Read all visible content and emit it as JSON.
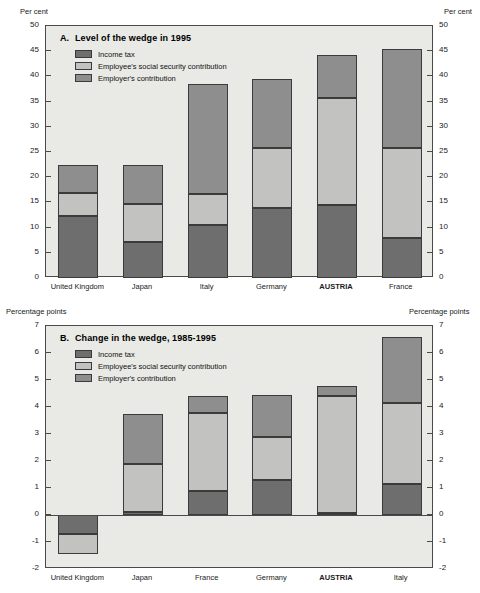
{
  "chart_data": [
    {
      "type": "bar",
      "panel": "A",
      "panel_letter": "A.",
      "title": "Level of the wedge in 1995",
      "xlabel": "",
      "ylabel": "Per cent",
      "ylabel_left": "Per cent",
      "ylabel_right": "Per cent",
      "ylim": [
        0,
        50
      ],
      "yticks": [
        0,
        5,
        10,
        15,
        20,
        25,
        30,
        35,
        40,
        45,
        50
      ],
      "grid": false,
      "stacked": true,
      "legend_position": "inside-top-left",
      "categories": [
        "United Kingdom",
        "Japan",
        "Italy",
        "Germany",
        "AUSTRIA",
        "France"
      ],
      "highlight_category": "AUSTRIA",
      "series": [
        {
          "name": "Income tax",
          "color": "#6e6e6e",
          "values": [
            12.3,
            7.2,
            10.6,
            13.8,
            14.5,
            7.9
          ]
        },
        {
          "name": "Employee's social security contribution",
          "color": "#c2c2c0",
          "values": [
            4.5,
            7.5,
            6.0,
            11.9,
            21.3,
            17.8
          ]
        },
        {
          "name": "Employer's contribution",
          "color": "#8e8e8e",
          "values": [
            5.6,
            7.7,
            21.9,
            13.8,
            8.4,
            19.8
          ]
        }
      ],
      "totals": [
        22.4,
        22.4,
        38.5,
        39.5,
        44.2,
        45.5
      ]
    },
    {
      "type": "bar",
      "panel": "B",
      "panel_letter": "B.",
      "title": "Change in the wedge, 1985-1995",
      "xlabel": "",
      "ylabel": "Percentage points",
      "ylabel_left": "Percentage points",
      "ylabel_right": "Percentage points",
      "ylim": [
        -2,
        7
      ],
      "yticks": [
        -2,
        -1,
        0,
        1,
        2,
        3,
        4,
        5,
        6,
        7
      ],
      "grid": false,
      "stacked": true,
      "legend_position": "inside-top-left",
      "categories": [
        "United Kingdom",
        "Japan",
        "France",
        "Germany",
        "AUSTRIA",
        "Italy"
      ],
      "highlight_category": "AUSTRIA",
      "series": [
        {
          "name": "Income tax",
          "color": "#6e6e6e",
          "values": [
            -0.72,
            0.1,
            0.88,
            1.3,
            0.08,
            1.15
          ]
        },
        {
          "name": "Employee's social security contribution",
          "color": "#c2c2c0",
          "values": [
            -0.73,
            1.8,
            2.9,
            1.6,
            4.32,
            3.0
          ]
        },
        {
          "name": "Employer's contribution",
          "color": "#8e8e8e",
          "values": [
            0,
            1.85,
            0.62,
            1.55,
            0.38,
            2.45
          ]
        }
      ],
      "totals": [
        -1.45,
        3.75,
        4.4,
        4.45,
        4.78,
        6.6
      ]
    }
  ],
  "panelA": {
    "panel_letter": "A.",
    "title": "Level of the wedge in 1995",
    "unit_left": "Per cent",
    "unit_right": "Per cent",
    "legend": [
      {
        "label": "Income tax"
      },
      {
        "label": "Employee's social security contribution"
      },
      {
        "label": "Employer's contribution"
      }
    ],
    "yticks": [
      "50",
      "45",
      "40",
      "35",
      "30",
      "25",
      "20",
      "15",
      "10",
      "5",
      "0"
    ],
    "categories": [
      "United Kingdom",
      "Japan",
      "Italy",
      "Germany",
      "AUSTRIA",
      "France"
    ]
  },
  "panelB": {
    "panel_letter": "B.",
    "title": "Change in the wedge, 1985-1995",
    "unit_left": "Percentage points",
    "unit_right": "Percentage points",
    "legend": [
      {
        "label": "Income tax"
      },
      {
        "label": "Employee's social security contribution"
      },
      {
        "label": "Employer's contribution"
      }
    ],
    "yticks": [
      "7",
      "6",
      "5",
      "4",
      "3",
      "2",
      "1",
      "0",
      "-1",
      "-2"
    ],
    "categories": [
      "United Kingdom",
      "Japan",
      "France",
      "Germany",
      "AUSTRIA",
      "Italy"
    ]
  },
  "colors": {
    "income_tax": "#6e6e6e",
    "employee_ss": "#c2c2c0",
    "employer": "#8e8e8e",
    "plot_background": "#e9e9e6",
    "axis": "#4a4a4a"
  }
}
